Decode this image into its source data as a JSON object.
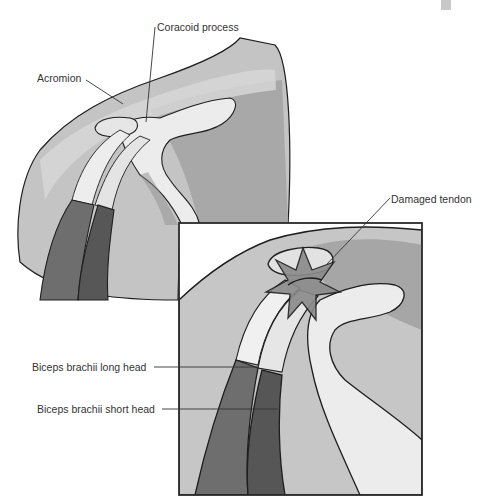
{
  "figure": {
    "colors": {
      "outline": "#1e1e1e",
      "skin_light": "#d4d4d4",
      "skin_mid": "#b4b4b4",
      "skin_dark": "#9a9a9a",
      "bone": "#eeeeee",
      "muscle": "#6e6e6e",
      "muscle_dark": "#4e4e4e"
    }
  },
  "labels": {
    "coracoid": "Coracoid process",
    "acromion": "Acromion",
    "damaged_tendon": "Damaged tendon",
    "long_head": "Biceps brachii long head",
    "short_head": "Biceps brachii short head"
  }
}
